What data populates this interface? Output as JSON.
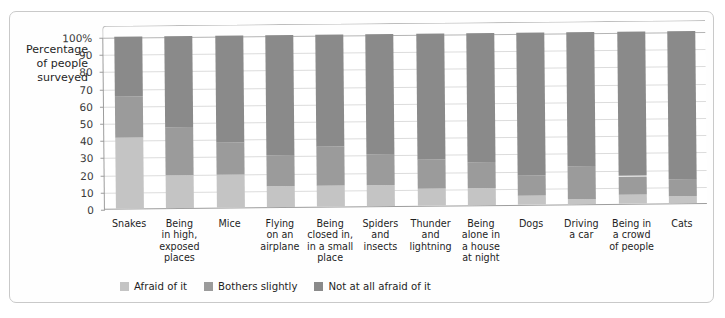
{
  "figure": {
    "frame_color": "#c9c9c9",
    "background": "#ffffff"
  },
  "chart_data": {
    "type": "bar",
    "subtype": "stacked-bar-100",
    "title": "",
    "xlabel": "",
    "ylabel": "Percentage of people surveyed",
    "ylim": [
      0,
      100
    ],
    "grid": true,
    "legend_position": "bottom",
    "ytick_labels": [
      "100%",
      "90",
      "80",
      "70",
      "60",
      "50",
      "40",
      "30",
      "20",
      "10",
      "0"
    ],
    "ytick_values": [
      100,
      90,
      80,
      70,
      60,
      50,
      40,
      30,
      20,
      10,
      0
    ],
    "categories": [
      "Snakes",
      "Being in high, exposed places",
      "Mice",
      "Flying on an airplane",
      "Being closed in, in a small place",
      "Spiders and insects",
      "Thunder and lightning",
      "Being alone in a house at night",
      "Dogs",
      "Driving a car",
      "Being in a crowd of people",
      "Cats"
    ],
    "category_label_lines": [
      [
        "Snakes"
      ],
      [
        "Being",
        "in high,",
        "exposed",
        "places"
      ],
      [
        "Mice"
      ],
      [
        "Flying",
        "on an",
        "airplane"
      ],
      [
        "Being",
        "closed in,",
        "in a small",
        "place"
      ],
      [
        "Spiders",
        "and",
        "insects"
      ],
      [
        "Thunder",
        "and",
        "lightning"
      ],
      [
        "Being",
        "alone in",
        "a house",
        "at night"
      ],
      [
        "Dogs"
      ],
      [
        "Driving",
        "a car"
      ],
      [
        "Being in",
        "a crowd",
        "of people"
      ],
      [
        "Cats"
      ]
    ],
    "series": [
      {
        "name": "Afraid of it",
        "color": "#c4c4c4",
        "values": [
          41,
          19,
          19,
          12,
          12,
          12,
          10,
          10,
          5,
          3,
          5,
          4
        ]
      },
      {
        "name": "Bothers slightly",
        "color": "#9b9b9b",
        "values": [
          24,
          28,
          19,
          18,
          23,
          18,
          17,
          15,
          12,
          19,
          11,
          10
        ]
      },
      {
        "name": "Not at all afraid of it",
        "color": "#8a8a8a",
        "values": [
          35,
          53,
          62,
          70,
          65,
          70,
          73,
          75,
          83,
          78,
          84,
          86
        ]
      }
    ]
  },
  "legend": {
    "items": [
      {
        "label": "Afraid of it",
        "color": "#c4c4c4"
      },
      {
        "label": "Bothers slightly",
        "color": "#9b9b9b"
      },
      {
        "label": "Not at all afraid of it",
        "color": "#8a8a8a"
      }
    ]
  },
  "axis": {
    "title_lines": [
      "Percentage",
      "of people",
      "surveyed"
    ]
  }
}
